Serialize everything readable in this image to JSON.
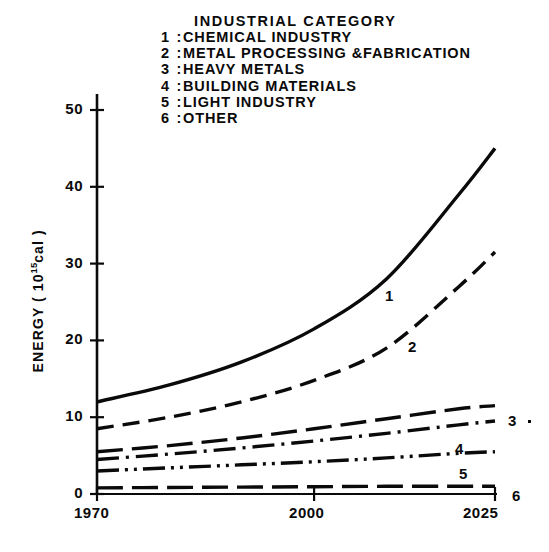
{
  "legend": {
    "title": "INDUSTRIAL  CATEGORY",
    "items": [
      {
        "num": "1",
        "sep": ":",
        "label": "CHEMICAL  INDUSTRY"
      },
      {
        "num": "2",
        "sep": ":",
        "label": "METAL PROCESSING &FABRICATION"
      },
      {
        "num": "3",
        "sep": ":",
        "label": "HEAVY  METALS"
      },
      {
        "num": "4",
        "sep": ":",
        "label": "BUILDING MATERIALS"
      },
      {
        "num": "5",
        "sep": ":",
        "label": "LIGHT  INDUSTRY"
      },
      {
        "num": "6",
        "sep": ":",
        "label": "OTHER"
      }
    ]
  },
  "axis": {
    "y_title_pre": "ENERGY ( 10",
    "y_title_sup": "15",
    "y_title_post": "cal )",
    "yticks": [
      "0",
      "10",
      "20",
      "30",
      "40",
      "50"
    ],
    "xticks": [
      "1970",
      "2000",
      "2025"
    ]
  },
  "curve_labels": [
    "1",
    "2",
    "3",
    "4",
    "5",
    "6"
  ],
  "colors": {
    "ink": "#0a0a0a",
    "background": "#ffffff"
  },
  "chart_data": {
    "type": "line",
    "title": "",
    "xlabel": "",
    "ylabel": "ENERGY ( 10^15 cal )",
    "xlim": [
      1970,
      2025
    ],
    "ylim": [
      0,
      55
    ],
    "yticks": [
      0,
      10,
      20,
      30,
      40,
      50
    ],
    "xticks": [
      1970,
      2000,
      2025
    ],
    "grid": false,
    "legend_position": "top-center",
    "x": [
      1970,
      1980,
      1990,
      2000,
      2010,
      2020,
      2025
    ],
    "series": [
      {
        "name": "1",
        "label": "CHEMICAL  INDUSTRY",
        "linestyle": "solid",
        "values": [
          12.0,
          14.2,
          17.2,
          21.5,
          28.0,
          39.0,
          45.0
        ]
      },
      {
        "name": "2",
        "label": "METAL PROCESSING &FABRICATION",
        "linestyle": "dashed",
        "values": [
          8.5,
          10.0,
          12.0,
          14.8,
          19.0,
          27.0,
          31.5
        ]
      },
      {
        "name": "3",
        "label": "HEAVY  METALS",
        "linestyle": "long-dash",
        "values": [
          5.5,
          6.3,
          7.3,
          8.5,
          9.8,
          11.1,
          11.5
        ]
      },
      {
        "name": "4",
        "label": "BUILDING MATERIALS",
        "linestyle": "dash-dot",
        "values": [
          4.5,
          5.2,
          6.0,
          6.9,
          7.9,
          9.0,
          9.5
        ]
      },
      {
        "name": "5",
        "label": "LIGHT  INDUSTRY",
        "linestyle": "dash-dot-dot",
        "values": [
          3.0,
          3.4,
          3.8,
          4.2,
          4.7,
          5.3,
          5.5
        ]
      },
      {
        "name": "6",
        "label": "OTHER",
        "linestyle": "long-dash",
        "values": [
          0.8,
          0.85,
          0.9,
          0.95,
          1.0,
          1.0,
          1.0
        ]
      }
    ]
  }
}
